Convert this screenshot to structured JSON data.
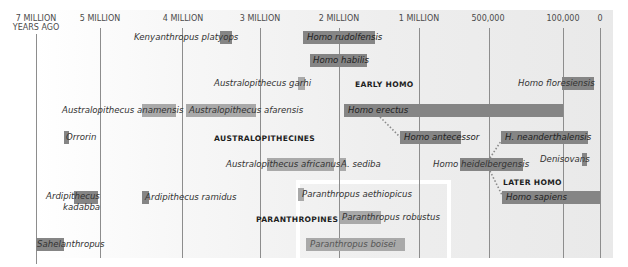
{
  "axis": {
    "ticks": [
      {
        "label": "7 MILLION",
        "sub": "YEARS AGO"
      },
      {
        "label": "5 MILLION"
      },
      {
        "label": "4 MILLION"
      },
      {
        "label": "3 MILLION"
      },
      {
        "label": "2 MILLION"
      },
      {
        "label": "1 MILLION"
      },
      {
        "label": "500,000"
      },
      {
        "label": "100,000"
      },
      {
        "label": "0"
      }
    ]
  },
  "groups": {
    "early_homo": "EARLY HOMO",
    "australopithecines": "AUSTRALOPITHECINES",
    "later_homo": "LATER HOMO",
    "paranthropines": "PARANTHROPINES"
  },
  "species": {
    "kenyanthropus_platyops": "Kenyanthropus platyops",
    "homo_rudolfensis": "Homo rudolfensis",
    "homo_habilis": "Homo habilis",
    "australopithecus_garhi": "Australopithecus garhi",
    "homo_floresiensis": "Homo floresiensis",
    "australopithecus_anamensis": "Australopithecus anamensis",
    "australopithecus_afarensis": "Australopithecus afarensis",
    "homo_erectus": "Homo erectus",
    "orrorin": "Orrorin",
    "homo_antecessor": "Homo antecessor",
    "h_neanderthalensis": "H. neanderthalensis",
    "australopithecus_africanus": "Australopithecus africanus",
    "a_sediba": "A. sediba",
    "homo_heidelbergensis": "Homo heidelbergensis",
    "denisovans": "Denisovans",
    "ardipithecus_kadabba_1": "Ardipithecus",
    "ardipithecus_kadabba_2": "kadabba",
    "ardipithecus_ramidus": "Ardipithecus ramidus",
    "paranthropus_aethiopicus": "Paranthropus aethiopicus",
    "homo_sapiens": "Homo sapiens",
    "paranthropus_robustus": "Paranthropus robustus",
    "sahelanthropus": "Sahelanthropus",
    "paranthropus_boisei": "Paranthropus boisei"
  },
  "colors": {
    "bar": "#858585",
    "bar_light": "#a9a9a9",
    "axis_line": "#8d8d8d",
    "link_dots": "#8a8a8a"
  }
}
